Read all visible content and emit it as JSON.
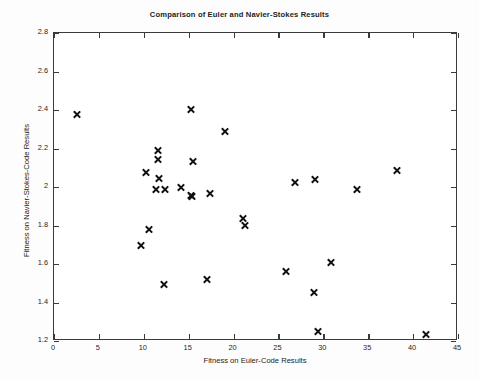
{
  "chart_data": {
    "type": "scatter",
    "title": "Comparison of Euler and Navier-Stokes Results",
    "xlabel": "Fitness on Euler-Code Results",
    "ylabel": "Fitness on Navier-Stokes-Code Results",
    "xlim": [
      0,
      45
    ],
    "ylim": [
      1.2,
      2.8
    ],
    "xticks": [
      0,
      5,
      10,
      15,
      20,
      25,
      30,
      35,
      40,
      45
    ],
    "xticklabels": [
      "0",
      "5",
      "10",
      "15",
      "20",
      "25",
      "30",
      "35",
      "40",
      "45"
    ],
    "yticks": [
      1.2,
      1.4,
      1.6,
      1.8,
      2.0,
      2.2,
      2.4,
      2.6,
      2.8
    ],
    "yticklabels": [
      "1.2",
      "1.4",
      "1.6",
      "1.8",
      "2",
      "2.2",
      "2.4",
      "2.6",
      "2.8"
    ],
    "grid": false,
    "legend": null,
    "marker": "x",
    "marker_color": "#111111",
    "series": [
      {
        "name": "Euler vs Navier-Stokes fitness",
        "points": [
          [
            2.5,
            2.375
          ],
          [
            9.7,
            1.695
          ],
          [
            10.2,
            2.075
          ],
          [
            10.6,
            1.78
          ],
          [
            11.4,
            1.985
          ],
          [
            11.6,
            2.19
          ],
          [
            11.6,
            2.145
          ],
          [
            11.7,
            2.045
          ],
          [
            12.3,
            1.495
          ],
          [
            12.4,
            1.985
          ],
          [
            14.1,
            1.995
          ],
          [
            15.3,
            2.405
          ],
          [
            15.3,
            1.955
          ],
          [
            15.4,
            1.95
          ],
          [
            15.5,
            2.135
          ],
          [
            17.0,
            1.52
          ],
          [
            17.4,
            1.965
          ],
          [
            19.0,
            2.29
          ],
          [
            21.0,
            1.835
          ],
          [
            21.3,
            1.8
          ],
          [
            25.8,
            1.56
          ],
          [
            26.8,
            2.025
          ],
          [
            29.0,
            1.45
          ],
          [
            29.1,
            2.04
          ],
          [
            29.4,
            1.25
          ],
          [
            30.9,
            1.61
          ],
          [
            33.7,
            1.985
          ],
          [
            38.2,
            2.085
          ],
          [
            41.4,
            1.235
          ]
        ]
      }
    ]
  }
}
